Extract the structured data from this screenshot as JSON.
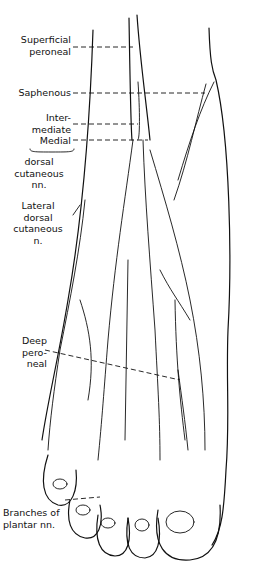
{
  "figure": {
    "labels": [
      {
        "id": "superficial-peroneal",
        "text": "Superficial\nperoneal"
      },
      {
        "id": "saphenous",
        "text": "Saphenous"
      },
      {
        "id": "intermediate",
        "text": "Inter-\nmediate"
      },
      {
        "id": "medial",
        "text": "Medial"
      },
      {
        "id": "dorsal-cutaneous-nn",
        "text": "dorsal\ncutaneous\nnn."
      },
      {
        "id": "lateral-dorsal-cutaneous",
        "text": "Lateral\ndorsal\ncutaneous\nn."
      },
      {
        "id": "deep-peroneal",
        "text": "Deep\npero-\nneal"
      },
      {
        "id": "branches-of-plantar",
        "text": "Branches of\nplantar nn."
      }
    ]
  }
}
